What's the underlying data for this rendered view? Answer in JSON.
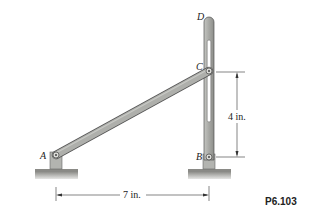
{
  "figure": {
    "problem_number": "P6.103",
    "points": {
      "A": "A",
      "B": "B",
      "C": "C",
      "D": "D"
    },
    "dimensions": {
      "vertical": "4 in.",
      "horizontal": "7 in."
    },
    "colors": {
      "member_fill": "#a9aaa6",
      "member_stroke": "#555555",
      "ground_fill": "#9a9a96",
      "dimension_line": "#333333"
    }
  }
}
